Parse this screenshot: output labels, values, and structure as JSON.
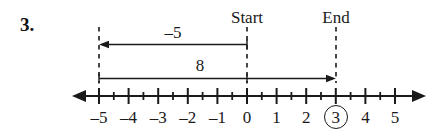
{
  "problem": {
    "number": "3."
  },
  "diagram": {
    "type": "number-line",
    "markers": [
      {
        "name": "start",
        "label": "Start",
        "value": 0
      },
      {
        "name": "end",
        "label": "End",
        "value": 3
      }
    ],
    "jumps": [
      {
        "name": "jump-negative-five",
        "label": "–5",
        "from": 0,
        "to": -5,
        "direction": "left"
      },
      {
        "name": "jump-eight",
        "label": "8",
        "from": -5,
        "to": 3,
        "direction": "right"
      }
    ],
    "axis": {
      "min": -5,
      "max": 5,
      "major_step": 1,
      "minor_step": 0.5,
      "left_arrow": true,
      "right_arrow": true,
      "tick_labels": [
        "–5",
        "–4",
        "–3",
        "–2",
        "–1",
        "0",
        "1",
        "2",
        "3",
        "4",
        "5"
      ],
      "tick_values": [
        -5,
        -4,
        -3,
        -2,
        -1,
        0,
        1,
        2,
        3,
        4,
        5
      ],
      "highlighted_value": 3,
      "highlighted_label": "3"
    },
    "colors": {
      "ink": "#1a1a1a",
      "background": "#ffffff"
    }
  }
}
